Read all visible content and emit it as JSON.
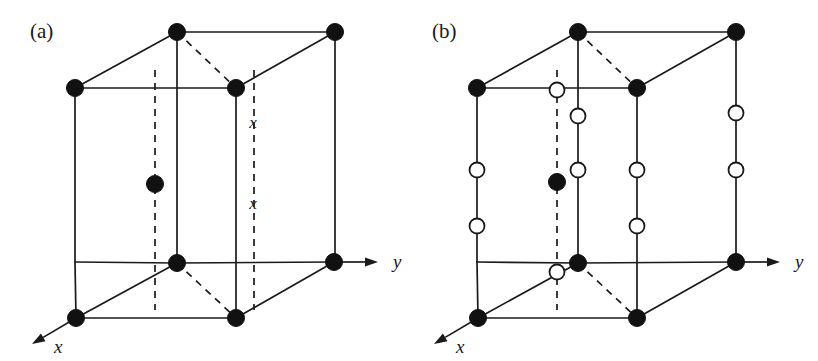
{
  "figure": {
    "background_color": "#ffffff",
    "line_color": "#1a1a1a",
    "filled_atom_color": "#111111",
    "open_atom_fill": "#ffffff"
  },
  "panels": [
    {
      "id": "a",
      "label": "(a)",
      "label_x": 30,
      "label_y": 38,
      "axes": [
        {
          "name": "y",
          "label": "y",
          "label_x": 393,
          "label_y": 268,
          "from_x": 334,
          "from_y": 262,
          "to_x": 378,
          "to_y": 262
        },
        {
          "name": "x",
          "label": "x",
          "label_x": 54,
          "label_y": 353,
          "from_x": 76,
          "from_y": 318,
          "to_x": 32,
          "to_y": 344
        }
      ],
      "solid_edges": [
        [
          177,
          32,
          335,
          32
        ],
        [
          75,
          88,
          236,
          88
        ],
        [
          75,
          88,
          177,
          32
        ],
        [
          236,
          88,
          335,
          32
        ],
        [
          75,
          88,
          75,
          262
        ],
        [
          177,
          32,
          177,
          263
        ],
        [
          236,
          88,
          236,
          318
        ],
        [
          335,
          32,
          335,
          262
        ],
        [
          75,
          262,
          177,
          263
        ],
        [
          177,
          263,
          334,
          262
        ],
        [
          76,
          318,
          236,
          318
        ],
        [
          76,
          318,
          177,
          263
        ],
        [
          236,
          318,
          334,
          262
        ],
        [
          75,
          262,
          76,
          318
        ]
      ],
      "dashed_edges": [
        [
          177,
          32,
          236,
          88
        ],
        [
          177,
          263,
          236,
          318
        ],
        [
          155,
          70,
          155,
          310
        ],
        [
          254,
          70,
          254,
          310
        ]
      ],
      "filled_atoms": [
        {
          "cx": 177,
          "cy": 32,
          "r": 8.5
        },
        {
          "cx": 335,
          "cy": 32,
          "r": 8.5
        },
        {
          "cx": 75,
          "cy": 88,
          "r": 8.5
        },
        {
          "cx": 236,
          "cy": 88,
          "r": 8.5
        },
        {
          "cx": 155,
          "cy": 184,
          "r": 8.5
        },
        {
          "cx": 177,
          "cy": 263,
          "r": 8.5
        },
        {
          "cx": 334,
          "cy": 262,
          "r": 8.5
        },
        {
          "cx": 76,
          "cy": 318,
          "r": 8.5
        },
        {
          "cx": 236,
          "cy": 318,
          "r": 8.5
        }
      ],
      "open_atoms": [],
      "markers": [
        {
          "text": "x",
          "x": 253,
          "y": 128
        },
        {
          "text": "x",
          "x": 253,
          "y": 209
        }
      ]
    },
    {
      "id": "b",
      "label": "(b)",
      "label_x": 432,
      "label_y": 38,
      "axes": [
        {
          "name": "y",
          "label": "y",
          "label_x": 795,
          "label_y": 268,
          "from_x": 736,
          "from_y": 262,
          "to_x": 780,
          "to_y": 262
        },
        {
          "name": "x",
          "label": "x",
          "label_x": 456,
          "label_y": 353,
          "from_x": 478,
          "from_y": 318,
          "to_x": 434,
          "to_y": 344
        }
      ],
      "solid_edges": [
        [
          578,
          32,
          736,
          32
        ],
        [
          477,
          88,
          637,
          88
        ],
        [
          477,
          88,
          578,
          32
        ],
        [
          637,
          88,
          736,
          32
        ],
        [
          477,
          88,
          477,
          262
        ],
        [
          578,
          32,
          578,
          263
        ],
        [
          637,
          88,
          637,
          318
        ],
        [
          736,
          32,
          736,
          262
        ],
        [
          477,
          262,
          578,
          263
        ],
        [
          578,
          263,
          736,
          262
        ],
        [
          478,
          318,
          637,
          318
        ],
        [
          478,
          318,
          578,
          263
        ],
        [
          637,
          318,
          736,
          262
        ],
        [
          477,
          262,
          478,
          318
        ]
      ],
      "dashed_edges": [
        [
          578,
          32,
          637,
          88
        ],
        [
          578,
          263,
          637,
          318
        ],
        [
          557,
          70,
          557,
          310
        ]
      ],
      "filled_atoms": [
        {
          "cx": 578,
          "cy": 32,
          "r": 8.5
        },
        {
          "cx": 736,
          "cy": 32,
          "r": 8.5
        },
        {
          "cx": 477,
          "cy": 88,
          "r": 8.5
        },
        {
          "cx": 637,
          "cy": 88,
          "r": 8.5
        },
        {
          "cx": 557,
          "cy": 182,
          "r": 8.5
        },
        {
          "cx": 578,
          "cy": 263,
          "r": 8.5
        },
        {
          "cx": 736,
          "cy": 262,
          "r": 8.5
        },
        {
          "cx": 478,
          "cy": 318,
          "r": 8.5
        },
        {
          "cx": 637,
          "cy": 318,
          "r": 8.5
        }
      ],
      "open_atoms": [
        {
          "cx": 557,
          "cy": 90,
          "r": 7.5
        },
        {
          "cx": 578,
          "cy": 116,
          "r": 7.5
        },
        {
          "cx": 736,
          "cy": 113,
          "r": 7.5
        },
        {
          "cx": 477,
          "cy": 170,
          "r": 7.5
        },
        {
          "cx": 578,
          "cy": 170,
          "r": 7.5
        },
        {
          "cx": 637,
          "cy": 170,
          "r": 7.5
        },
        {
          "cx": 736,
          "cy": 170,
          "r": 7.5
        },
        {
          "cx": 477,
          "cy": 226,
          "r": 7.5
        },
        {
          "cx": 637,
          "cy": 226,
          "r": 7.5
        },
        {
          "cx": 557,
          "cy": 272,
          "r": 7.5
        }
      ],
      "markers": []
    }
  ]
}
